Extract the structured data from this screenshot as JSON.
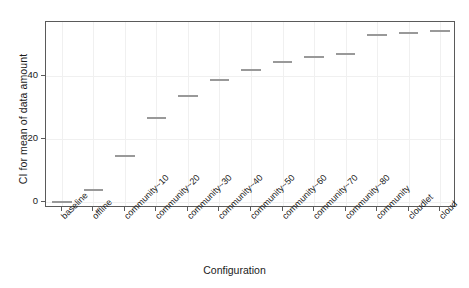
{
  "chart_data": {
    "type": "line",
    "title": "",
    "xlabel": "Configuration",
    "ylabel": "CI for mean of data amount",
    "categories": [
      "baseline",
      "offline",
      "community~10",
      "community~20",
      "community~30",
      "community~40",
      "community~50",
      "community~60",
      "community~70",
      "community~80",
      "community",
      "cloudlet",
      "cloud"
    ],
    "values": [
      0.0,
      3.8,
      14.6,
      26.5,
      33.5,
      38.6,
      41.8,
      44.2,
      45.8,
      47.0,
      53.0,
      53.6,
      54.3
    ],
    "series": [
      {
        "name": "CI for mean of data amount",
        "values": [
          0.0,
          3.8,
          14.6,
          26.5,
          33.5,
          38.6,
          41.8,
          44.2,
          45.8,
          47.0,
          53.0,
          53.6,
          54.3
        ]
      }
    ],
    "ylim": [
      -2.0,
      57.0
    ],
    "yticks": [
      0,
      20,
      40
    ],
    "ytick_labels": [
      "0",
      "20",
      "40"
    ],
    "grid": true,
    "legend": false,
    "legend_position": "none",
    "marker_style": "horizontal-interval-bar",
    "series_color": "#999999",
    "axis_color": "#5a5a5a",
    "grid_color": "#f0f0f0",
    "background": "#ffffff",
    "annotations": []
  }
}
